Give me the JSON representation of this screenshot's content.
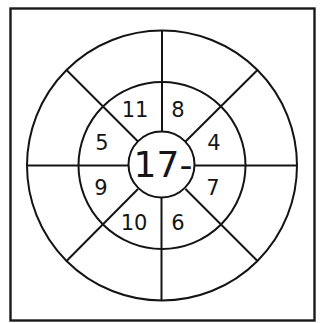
{
  "puzzle": {
    "type": "subtraction-wheel",
    "center_label": "17-",
    "inner_ring_numbers": [
      {
        "position": "top-right",
        "value": "8"
      },
      {
        "position": "right-top",
        "value": "4"
      },
      {
        "position": "right-bottom",
        "value": "7"
      },
      {
        "position": "bottom-right",
        "value": "6"
      },
      {
        "position": "bottom-left",
        "value": "10"
      },
      {
        "position": "left-bottom",
        "value": "9"
      },
      {
        "position": "left-top",
        "value": "5"
      },
      {
        "position": "top-left",
        "value": "11"
      }
    ],
    "outer_ring_answers": [
      "",
      "",
      "",
      "",
      "",
      "",
      "",
      ""
    ]
  },
  "colors": {
    "line": "#141414",
    "background": "#ffffff"
  }
}
